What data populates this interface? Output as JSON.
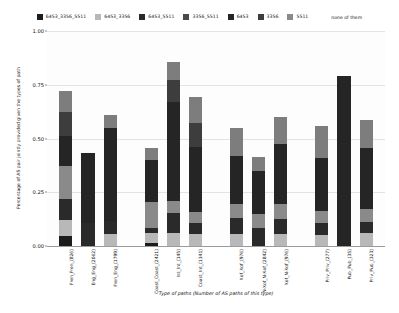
{
  "chart_data": {
    "type": "bar",
    "stacked": true,
    "title": "",
    "xlabel": "Type of paths (Number of AS paths of this type)",
    "ylabel": "Percentage of AS pair jointly provided given the types of path",
    "ylim": [
      0.0,
      1.0
    ],
    "yticks": [
      "0.00",
      "0.25",
      "0.50",
      "0.75",
      "1.00"
    ],
    "ytick_values": [
      0.0,
      0.25,
      0.5,
      0.75,
      1.0
    ],
    "grid": true,
    "legend_position": "top",
    "legend_extra": "none of them",
    "categories": [
      "Fren_Fren_(826)",
      "Eng_Eng_(2062)",
      "Fren_Eng_(1799)",
      "Coast_Coast_(2421)",
      "Int_Int_(145)",
      "Coast_Int_(1341)",
      "Xof_Xof_(976)",
      "N-Xof_N-Xof_(2842)",
      "Xof_N-Xof_(976)",
      "Priv_Priv_(277)",
      "Pub_Pub_(35)",
      "Priv_Pub_(323)"
    ],
    "group_breaks": [
      3,
      6,
      9
    ],
    "series": [
      {
        "name": "6453_3356_5511",
        "color": "#1c1c1c",
        "values": [
          0.045,
          0.0,
          0.0,
          0.012,
          0.0,
          0.0,
          0.0,
          0.0,
          0.0,
          0.0,
          0.0,
          0.0
        ]
      },
      {
        "name": "6453_3356",
        "color": "#b8b8b8",
        "values": [
          0.075,
          0.0,
          0.055,
          0.05,
          0.06,
          0.055,
          0.055,
          0.0,
          0.055,
          0.05,
          0.0,
          0.06
        ]
      },
      {
        "name": "6453_5511",
        "color": "#2a2a2a",
        "values": [
          0.1,
          0.105,
          0.06,
          0.022,
          0.095,
          0.05,
          0.075,
          0.085,
          0.07,
          0.055,
          0.0,
          0.05
        ]
      },
      {
        "name": "3356_5511",
        "color": "#4a4a4a",
        "values": [
          0.0,
          0.0,
          0.0,
          0.0,
          0.0,
          0.0,
          0.0,
          0.0,
          0.0,
          0.0,
          0.0,
          0.0
        ]
      },
      {
        "name": "6453",
        "color": "#8a8a8a",
        "values": [
          0.15,
          0.0,
          0.0,
          0.12,
          0.055,
          0.055,
          0.065,
          0.065,
          0.07,
          0.06,
          0.0,
          0.06
        ]
      },
      {
        "name": "3356",
        "color": "#252525",
        "values": [
          0.14,
          0.33,
          0.435,
          0.195,
          0.46,
          0.3,
          0.225,
          0.2,
          0.28,
          0.245,
          0.79,
          0.285
        ]
      },
      {
        "name": "5511",
        "color": "#3d3d3d",
        "values": [
          0.115,
          0.0,
          0.0,
          0.0,
          0.1,
          0.11,
          0.0,
          0.0,
          0.0,
          0.0,
          0.0,
          0.0
        ]
      },
      {
        "name": "none of them",
        "color": "#7d7d7d",
        "values": [
          0.095,
          0.0,
          0.06,
          0.055,
          0.085,
          0.125,
          0.13,
          0.065,
          0.125,
          0.15,
          0.0,
          0.13
        ]
      }
    ]
  },
  "legend": {
    "items": [
      {
        "label": "6453_3356_5511",
        "color": "#1c1c1c"
      },
      {
        "label": "6453_3356",
        "color": "#b8b8b8"
      },
      {
        "label": "6453_5511",
        "color": "#2a2a2a"
      },
      {
        "label": "3356_5511",
        "color": "#4a4a4a"
      },
      {
        "label": "6453",
        "color": "#252525"
      },
      {
        "label": "3356",
        "color": "#3d3d3d"
      },
      {
        "label": "5511",
        "color": "#8a8a8a"
      }
    ],
    "trailing_label": "none of them"
  }
}
